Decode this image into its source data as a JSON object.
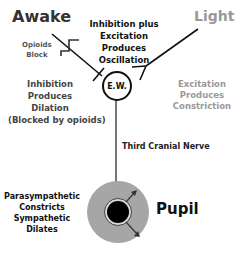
{
  "diagram": {
    "inputs": {
      "awake": "Awake",
      "light": "Light"
    },
    "opioids_block": [
      "Opioids",
      "Block"
    ],
    "center_note": [
      "Inhibition plus",
      "Excitation",
      "Produces",
      "Oscillation"
    ],
    "awake_effect": [
      "Inhibition",
      "Produces",
      "Dilation",
      "(Blocked by opioids)"
    ],
    "light_effect": [
      "Excitation",
      "Produces",
      "Constriction"
    ],
    "nucleus": "E.W.",
    "nerve": "Third Cranial Nerve",
    "pupil_note": [
      "Parasympathetic",
      "Constricts",
      "Sympathetic",
      "Dilates"
    ],
    "pupil_label": "Pupil",
    "colors": {
      "awake_text": "#333333",
      "light_text": "#999999",
      "iris": "#a6a6a6",
      "pupil": "#000000",
      "line": "#111111"
    }
  }
}
